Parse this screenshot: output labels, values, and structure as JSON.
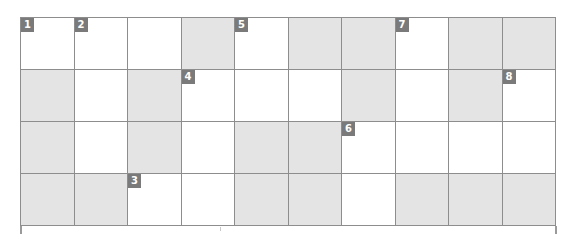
{
  "puzzle": {
    "type": "crossword-grid",
    "columns": 10,
    "rows_count": 4,
    "colors": {
      "grid_line": "#8d8d8d",
      "shaded_cell": "#e4e4e4",
      "open_cell": "#ffffff",
      "badge_background": "#7a7a7a",
      "badge_text": "#ffffff"
    },
    "rows": [
      [
        {
          "shaded": false,
          "number": "1"
        },
        {
          "shaded": false,
          "number": "2"
        },
        {
          "shaded": false,
          "number": ""
        },
        {
          "shaded": true,
          "number": ""
        },
        {
          "shaded": false,
          "number": "5"
        },
        {
          "shaded": true,
          "number": ""
        },
        {
          "shaded": true,
          "number": ""
        },
        {
          "shaded": false,
          "number": "7"
        },
        {
          "shaded": true,
          "number": ""
        },
        {
          "shaded": true,
          "number": ""
        }
      ],
      [
        {
          "shaded": true,
          "number": ""
        },
        {
          "shaded": false,
          "number": ""
        },
        {
          "shaded": true,
          "number": ""
        },
        {
          "shaded": false,
          "number": "4"
        },
        {
          "shaded": false,
          "number": ""
        },
        {
          "shaded": false,
          "number": ""
        },
        {
          "shaded": true,
          "number": ""
        },
        {
          "shaded": false,
          "number": ""
        },
        {
          "shaded": true,
          "number": ""
        },
        {
          "shaded": false,
          "number": "8"
        }
      ],
      [
        {
          "shaded": true,
          "number": ""
        },
        {
          "shaded": false,
          "number": ""
        },
        {
          "shaded": true,
          "number": ""
        },
        {
          "shaded": false,
          "number": ""
        },
        {
          "shaded": true,
          "number": ""
        },
        {
          "shaded": true,
          "number": ""
        },
        {
          "shaded": false,
          "number": "6"
        },
        {
          "shaded": false,
          "number": ""
        },
        {
          "shaded": false,
          "number": ""
        },
        {
          "shaded": false,
          "number": ""
        }
      ],
      [
        {
          "shaded": true,
          "number": ""
        },
        {
          "shaded": true,
          "number": ""
        },
        {
          "shaded": false,
          "number": "3"
        },
        {
          "shaded": false,
          "number": ""
        },
        {
          "shaded": true,
          "number": ""
        },
        {
          "shaded": true,
          "number": ""
        },
        {
          "shaded": false,
          "number": ""
        },
        {
          "shaded": true,
          "number": ""
        },
        {
          "shaded": true,
          "number": ""
        },
        {
          "shaded": true,
          "number": ""
        }
      ]
    ]
  }
}
